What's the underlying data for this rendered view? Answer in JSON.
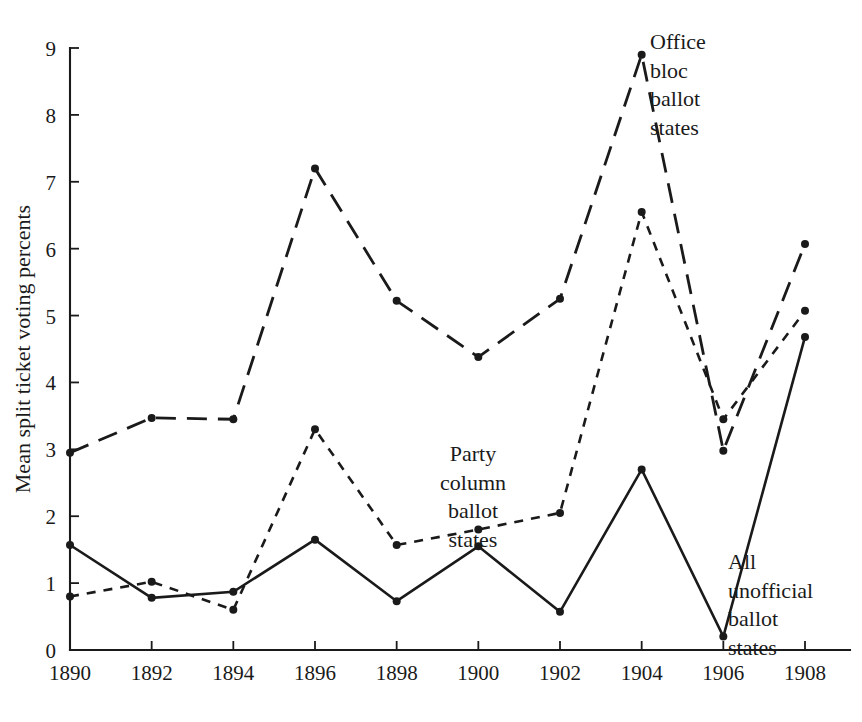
{
  "chart_data": {
    "type": "line",
    "title": "",
    "xlabel": "",
    "ylabel": "Mean split ticket voting percents",
    "x": [
      1890,
      1892,
      1894,
      1896,
      1898,
      1900,
      1902,
      1904,
      1906,
      1908
    ],
    "xtick_labels": [
      "1890",
      "1892",
      "1894",
      "1896",
      "1898",
      "1900",
      "1902",
      "1904",
      "1906",
      "1908"
    ],
    "ytick_labels": [
      "0",
      "1",
      "2",
      "3",
      "4",
      "5",
      "6",
      "7",
      "8",
      "9"
    ],
    "ytick_values": [
      0,
      1,
      2,
      3,
      4,
      5,
      6,
      7,
      8,
      9
    ],
    "xlim": [
      1890,
      1908
    ],
    "ylim": [
      0,
      9
    ],
    "grid": false,
    "legend_position": "inline-annotations",
    "series": [
      {
        "name": "Office bloc ballot states",
        "style": "long-dashed",
        "values": [
          2.95,
          3.47,
          3.45,
          7.2,
          5.22,
          4.38,
          5.25,
          8.9,
          2.98,
          6.07
        ]
      },
      {
        "name": "Party column ballot states",
        "style": "short-dashed",
        "values": [
          0.8,
          1.02,
          0.6,
          3.3,
          1.57,
          1.8,
          2.05,
          6.55,
          3.45,
          5.07
        ]
      },
      {
        "name": "All unofficial ballot states",
        "style": "solid",
        "values": [
          1.57,
          0.78,
          0.87,
          1.65,
          0.73,
          1.55,
          0.57,
          2.7,
          0.2,
          4.68
        ]
      }
    ],
    "annotations": [
      {
        "id": "office",
        "text": "Office\nbloc\nballot\nstates"
      },
      {
        "id": "party",
        "text": "Party\ncolumn\nballot\nstates"
      },
      {
        "id": "all",
        "text": "All\nunofficial\nballot\nstates"
      }
    ]
  }
}
